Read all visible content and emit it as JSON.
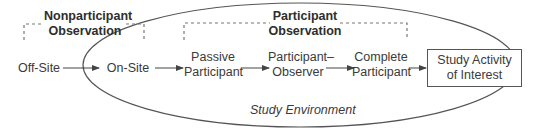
{
  "diagram": {
    "groups": {
      "nonparticipant": {
        "line1": "Nonparticipant",
        "line2": "Observation"
      },
      "participant": {
        "line1": "Participant",
        "line2": "Observation"
      }
    },
    "nodes": [
      {
        "id": "off-site",
        "line1": "Off-Site",
        "line2": ""
      },
      {
        "id": "on-site",
        "line1": "On-Site",
        "line2": ""
      },
      {
        "id": "passive-participant",
        "line1": "Passive",
        "line2": "Participant"
      },
      {
        "id": "participant-observer",
        "line1": "Participant–",
        "line2": "Observer"
      },
      {
        "id": "complete-participant",
        "line1": "Complete",
        "line2": "Participant"
      },
      {
        "id": "study-activity",
        "line1": "Study Activity",
        "line2": "of Interest"
      }
    ],
    "environment_label": "Study Environment",
    "edges": [
      [
        "off-site",
        "on-site"
      ],
      [
        "on-site",
        "passive-participant"
      ],
      [
        "passive-participant",
        "participant-observer"
      ],
      [
        "participant-observer",
        "complete-participant"
      ],
      [
        "complete-participant",
        "study-activity"
      ]
    ],
    "colors": {
      "line": "#555555",
      "dashed": "#777777",
      "text": "#3a3a3a"
    }
  }
}
